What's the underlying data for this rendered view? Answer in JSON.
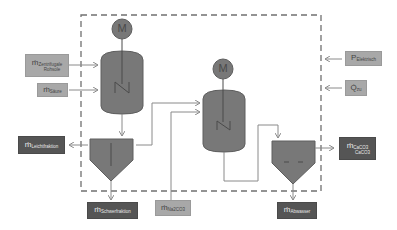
{
  "diagram": {
    "type": "process-flow",
    "colors": {
      "vessel_fill": "#787878",
      "vessel_stroke": "#5e5e5e",
      "line": "#8a8a8a",
      "boundary": "#707070",
      "input_box": "#a8a8a8",
      "output_box": "#555555"
    },
    "motors": [
      {
        "id": "motor-1",
        "label": "M"
      },
      {
        "id": "motor-2",
        "label": "M"
      }
    ],
    "inputs": [
      {
        "id": "input-feed",
        "symbol": "ṁ",
        "subscript": "Zentrifugale",
        "line2": "Rohsole"
      },
      {
        "id": "input-water",
        "symbol": "ṁ",
        "subscript": "Säure"
      },
      {
        "id": "input-power",
        "symbol": "P",
        "subscript": "Elektrisch"
      },
      {
        "id": "input-heat",
        "symbol": "Q̇",
        "subscript": "zu"
      },
      {
        "id": "input-na2co3",
        "symbol": "ṁ",
        "subscript": "Na2CO3"
      }
    ],
    "outputs": [
      {
        "id": "output-left",
        "symbol": "ṁ",
        "subscript": "Leichtfraktion"
      },
      {
        "id": "output-sludge",
        "symbol": "ṁ",
        "subscript": "Schwerfraktion"
      },
      {
        "id": "output-product",
        "symbol": "ṁ",
        "subscript": "CaCO3",
        "line2": "CaCO3"
      },
      {
        "id": "output-wastewater",
        "symbol": "ṁ",
        "subscript": "Abwasser"
      }
    ]
  }
}
